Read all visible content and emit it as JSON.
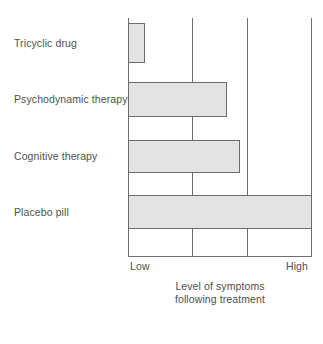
{
  "chart_data": {
    "type": "bar",
    "orientation": "horizontal",
    "title": "",
    "subtitle": "",
    "xlabel": "Level of symptoms\nfollowing treatment",
    "xlabel_line1": "Level of symptoms",
    "xlabel_line2": "following treatment",
    "ylabel": "",
    "categories": [
      "Tricyclic drug",
      "Psychodynamic therapy",
      "Cognitive therapy",
      "Placebo pill"
    ],
    "values": [
      9,
      54,
      61,
      100
    ],
    "value_unit": "percent of axis span",
    "xlim": [
      0,
      100
    ],
    "xticks": [
      0,
      100
    ],
    "xtick_labels": [
      "Low",
      "High"
    ],
    "gridlines_x": [
      0,
      35,
      65,
      100
    ],
    "grid": true,
    "legend": "none",
    "bar_fill_color": "#e3e3e3",
    "bar_border_color": "#6b6b6b",
    "axis_color": "#6e6e6e",
    "text_color": "#4f4f4f",
    "background_color": "#ffffff",
    "bars": [
      {
        "label": "Tricyclic drug",
        "value": 9,
        "top_pct": 2.1,
        "height_pct": 16.7
      },
      {
        "label": "Psychodynamic therapy",
        "value": 54,
        "top_pct": 26.8,
        "height_pct": 14.6
      },
      {
        "label": "Cognitive therapy",
        "value": 61,
        "top_pct": 51.0,
        "height_pct": 13.8
      },
      {
        "label": "Placebo pill",
        "value": 100,
        "top_pct": 74.1,
        "height_pct": 14.2
      }
    ]
  },
  "axis": {
    "tick_low": "Low",
    "tick_high": "High",
    "title_line1": "Level of symptoms",
    "title_line2": "following treatment"
  }
}
